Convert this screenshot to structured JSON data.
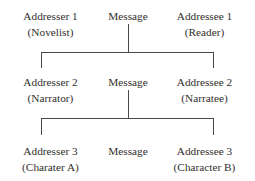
{
  "diagram": {
    "ink_color": "#332f2d",
    "line_color": "#4a4745",
    "background_color": "#ffffff",
    "levels": [
      {
        "addresser": {
          "main": "Addresser 1",
          "sub": "(Novelist)"
        },
        "message": {
          "main": "Message"
        },
        "addressee": {
          "main": "Addressee 1",
          "sub": "(Reader)"
        }
      },
      {
        "addresser": {
          "main": "Addresser 2",
          "sub": "(Narrator)"
        },
        "message": {
          "main": "Message"
        },
        "addressee": {
          "main": "Addressee 2",
          "sub": "(Narratee)"
        }
      },
      {
        "addresser": {
          "main": "Addresser 3",
          "sub": "(Charater A)"
        },
        "message": {
          "main": "Message"
        },
        "addressee": {
          "main": "Addressee 3",
          "sub": "(Character B)"
        }
      }
    ]
  }
}
